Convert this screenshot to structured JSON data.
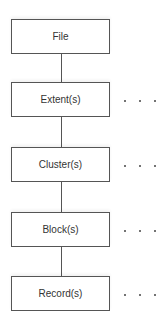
{
  "diagram": {
    "type": "hierarchy",
    "nodes": [
      {
        "label": "File",
        "continues": false
      },
      {
        "label": "Extent(s)",
        "continues": true
      },
      {
        "label": "Cluster(s)",
        "continues": true
      },
      {
        "label": "Block(s)",
        "continues": true
      },
      {
        "label": "Record(s)",
        "continues": true
      }
    ],
    "continuation_marker": ". . ."
  }
}
